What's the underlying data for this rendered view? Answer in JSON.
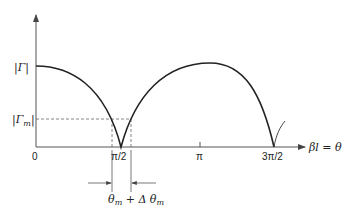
{
  "diagram": {
    "y_axis": {
      "labels": {
        "gamma": "|Γ|",
        "gamma_m": "|Γ",
        "gamma_m_sub": "m",
        "gamma_m_close": "|"
      }
    },
    "x_axis": {
      "label": "βl = θ",
      "ticks": [
        "0",
        "π/2",
        "π",
        "3π/2"
      ]
    },
    "annotation": {
      "bandwidth_label": "θ",
      "bandwidth_sub": "m",
      "bandwidth_plus": " + Δ θ",
      "bandwidth_sub2": "m"
    },
    "colors": {
      "curve": "#222222",
      "axis": "#555555",
      "dashed": "#666666"
    }
  }
}
